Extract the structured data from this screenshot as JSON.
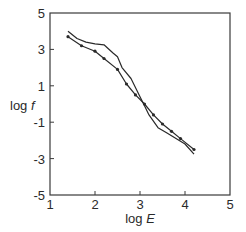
{
  "chart_data": {
    "type": "line",
    "title": "",
    "xlabel": "log E",
    "ylabel": "log f",
    "xlim": [
      1,
      5
    ],
    "ylim": [
      -5,
      5
    ],
    "xticks": [
      1,
      2,
      3,
      4,
      5
    ],
    "yticks": [
      5,
      3,
      1,
      -1,
      -3,
      -5
    ],
    "grid": false,
    "legend": null,
    "series": [
      {
        "name": "solid line",
        "style": "solid",
        "points": [
          [
            1.4,
            4.0
          ],
          [
            1.6,
            3.6
          ],
          [
            1.8,
            3.4
          ],
          [
            2.0,
            3.3
          ],
          [
            2.2,
            3.25
          ],
          [
            2.4,
            2.8
          ],
          [
            2.5,
            2.6
          ],
          [
            2.6,
            2.0
          ],
          [
            2.8,
            1.4
          ],
          [
            3.0,
            0.4
          ],
          [
            3.1,
            -0.1
          ],
          [
            3.2,
            -0.6
          ],
          [
            3.4,
            -1.3
          ],
          [
            3.6,
            -1.6
          ],
          [
            3.8,
            -1.9
          ],
          [
            4.0,
            -2.2
          ],
          [
            4.2,
            -2.75
          ]
        ]
      },
      {
        "name": "dotted line with markers",
        "style": "solid-with-dots",
        "points": [
          [
            1.4,
            3.7
          ],
          [
            1.7,
            3.2
          ],
          [
            2.0,
            2.9
          ],
          [
            2.2,
            2.5
          ],
          [
            2.5,
            1.9
          ],
          [
            2.7,
            1.1
          ],
          [
            2.9,
            0.5
          ],
          [
            3.1,
            0.0
          ],
          [
            3.3,
            -0.6
          ],
          [
            3.5,
            -1.1
          ],
          [
            3.7,
            -1.5
          ],
          [
            3.9,
            -1.9
          ],
          [
            4.2,
            -2.5
          ]
        ]
      }
    ]
  },
  "colors": {
    "line": "#2a2a2a",
    "frame": "#3a3a3a",
    "background": "#ffffff"
  }
}
